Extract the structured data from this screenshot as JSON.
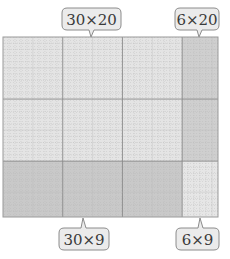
{
  "diagram": {
    "grid": {
      "cols": 36,
      "rows": 29,
      "split_col": 30,
      "split_row": 20
    },
    "regions": [
      {
        "id": "tl",
        "label": "30 × 20",
        "fill": "#e4e4e4"
      },
      {
        "id": "tr",
        "label": "6 × 20",
        "fill": "#cfcfcf"
      },
      {
        "id": "bl",
        "label": "30 × 9",
        "fill": "#c9c9c9"
      },
      {
        "id": "br",
        "label": "6 × 9",
        "fill": "#e6e6e6"
      }
    ],
    "callouts": {
      "top_left": "30×20",
      "top_right": "6×20",
      "bottom_left": "30×9",
      "bottom_right": "6×9"
    },
    "colors": {
      "grid_line_minor": "#b8b8b8",
      "grid_line_major": "#8a8a8a",
      "callout_fill": "#ebebeb",
      "callout_stroke": "#8c8c8c",
      "text": "#333333"
    }
  }
}
